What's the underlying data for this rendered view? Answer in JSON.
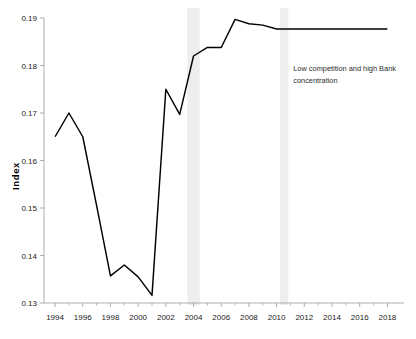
{
  "chart_data": {
    "type": "line",
    "title": "",
    "xlabel": "",
    "ylabel": "Index",
    "xlim": [
      1993.2,
      2019.2
    ],
    "ylim": [
      0.13,
      0.19
    ],
    "grid": false,
    "legend": null,
    "x": [
      1994,
      1995,
      1996,
      1997,
      1998,
      1999,
      2000,
      2001,
      2002,
      2003,
      2004,
      2005,
      2006,
      2007,
      2008,
      2009,
      2010,
      2011,
      2012,
      2013,
      2014,
      2015,
      2016,
      2017,
      2018
    ],
    "series": [
      {
        "name": "Index",
        "color": "#000000",
        "values": [
          0.165,
          0.17,
          0.165,
          0.1505,
          0.1357,
          0.138,
          0.1355,
          0.1316,
          0.175,
          0.1697,
          0.182,
          0.1838,
          0.1838,
          0.1897,
          0.1888,
          0.1885,
          0.1877,
          0.1877,
          0.1877,
          0.1877,
          0.1877,
          0.1877,
          0.1877,
          0.1877,
          0.1877
        ]
      }
    ],
    "ytick_labels": [
      "0.13",
      "0.14",
      "0.15",
      "0.16",
      "0.17",
      "0.18",
      "0.19"
    ],
    "ytick_values": [
      0.13,
      0.14,
      0.15,
      0.16,
      0.17,
      0.18,
      0.19
    ],
    "xtick_labels": [
      "1994",
      "1996",
      "1998",
      "2000",
      "2002",
      "2004",
      "2006",
      "2008",
      "2010",
      "2012",
      "2014",
      "2016",
      "2018"
    ],
    "xtick_values": [
      1994,
      1996,
      1998,
      2000,
      2002,
      2004,
      2006,
      2008,
      2010,
      2012,
      2014,
      2016,
      2018
    ],
    "xtick_minor_values": [
      1995,
      1997,
      1999,
      2001,
      2003,
      2005,
      2007,
      2009,
      2011,
      2013,
      2015,
      2017
    ],
    "shaded_bands": [
      {
        "from": 2003.55,
        "to": 2004.45,
        "color": "#e8e8e8"
      },
      {
        "from": 2010.25,
        "to": 2010.85,
        "color": "#e8e8e8"
      }
    ],
    "annotations": [
      {
        "name": "low-competition-note",
        "line1": "Low competition and high Bank",
        "line2": "concentration",
        "x": 2011.2,
        "y": 0.1788
      }
    ],
    "colors": {
      "line": "#000000",
      "axis": "#9a9a9a",
      "text": "#1a1a1a",
      "band": "#e8e8e8",
      "background": "#ffffff"
    }
  }
}
